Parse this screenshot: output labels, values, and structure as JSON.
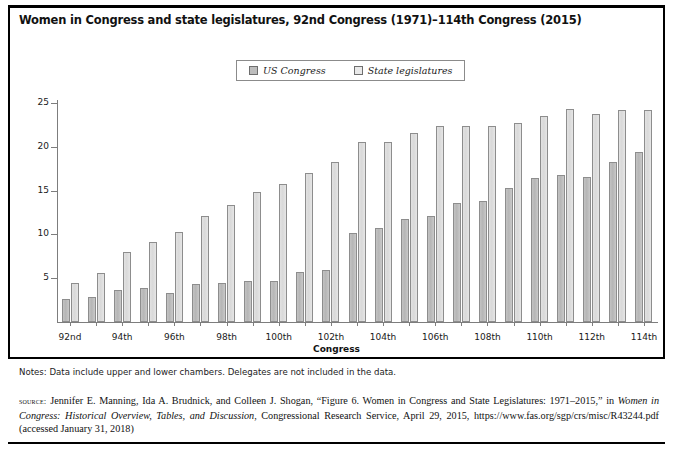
{
  "title": "Women in Congress and state legislatures, 92nd Congress (1971)–114th Congress (2015)",
  "legend": {
    "items": [
      {
        "label": "US Congress",
        "color": "#bdbdbd"
      },
      {
        "label": "State legislatures",
        "color": "#e0e0e0"
      }
    ]
  },
  "notes": "Notes: Data include upper and lower chambers. Delegates are not included in the data.",
  "source": {
    "label": "source:",
    "text_1": " Jennifer E. Manning, Ida A. Brudnick, and Colleen J. Shogan, “Figure 6. Women in Congress and State Legislatures: 1971–2015,” in ",
    "italic_1": "Women in Congress: Historical Overview, Tables, and Discussion",
    "text_2": ", Congressional Research Service, April 29, 2015, https://www.fas.org/sgp/crs/misc/R43244.pdf (accessed January 31, 2018)"
  },
  "chart_data": {
    "type": "bar",
    "title": "Women in Congress and state legislatures, 92nd Congress (1971)–114th Congress (2015)",
    "xlabel": "Congress",
    "ylabel": "Percent",
    "ylim": [
      0,
      25
    ],
    "yticks": [
      0,
      5,
      10,
      15,
      20,
      25
    ],
    "ytick_labels": [
      "",
      "5",
      "10",
      "15",
      "20",
      "25"
    ],
    "grid": false,
    "legend_position": "top-center",
    "categories": [
      "92nd",
      "93rd",
      "94th",
      "95th",
      "96th",
      "97th",
      "98th",
      "99th",
      "100th",
      "101st",
      "102nd",
      "103rd",
      "104th",
      "105th",
      "106th",
      "107th",
      "108th",
      "109th",
      "110th",
      "111th",
      "112th",
      "113th",
      "114th"
    ],
    "xtick_labels_shown": [
      "92nd",
      "",
      "94th",
      "",
      "96th",
      "",
      "98th",
      "",
      "100th",
      "",
      "102th",
      "",
      "104th",
      "",
      "106th",
      "",
      "108th",
      "",
      "110th",
      "",
      "112th",
      "",
      "114th"
    ],
    "series": [
      {
        "name": "US Congress",
        "color": "#bdbdbd",
        "values": [
          2.6,
          2.8,
          3.7,
          3.9,
          3.3,
          4.3,
          4.5,
          4.7,
          4.7,
          5.7,
          5.9,
          10.2,
          10.7,
          11.8,
          12.1,
          13.6,
          13.8,
          15.3,
          16.4,
          16.8,
          16.6,
          18.3,
          19.4
        ]
      },
      {
        "name": "State legislatures",
        "color": "#e0e0e0",
        "values": [
          4.5,
          5.6,
          8.0,
          9.1,
          10.3,
          12.1,
          13.4,
          14.8,
          15.7,
          17.0,
          18.3,
          20.6,
          20.6,
          21.6,
          22.4,
          22.4,
          22.4,
          22.7,
          23.5,
          24.3,
          23.7,
          24.2,
          24.2
        ]
      }
    ]
  }
}
